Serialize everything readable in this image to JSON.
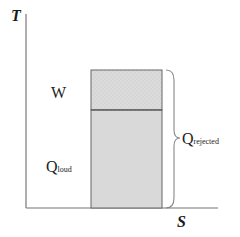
{
  "diagram": {
    "type": "T-S diagram",
    "axes": {
      "y_label": "T",
      "x_label": "S"
    },
    "regions": [
      {
        "label": "W",
        "description": "upper shaded region (work)",
        "fill": "#d8d8d8"
      },
      {
        "label_main": "Q",
        "label_sub": "loud",
        "description": "lower shaded region",
        "fill": "#d9d9d9"
      }
    ],
    "brace": {
      "label_main": "Q",
      "label_sub": "rejected",
      "spans": "full rectangle height"
    },
    "colors": {
      "axis": "#777777",
      "rect_fill": "#d9d9d9",
      "rect_stroke": "#666666",
      "brace": "#888888",
      "text": "#222222"
    }
  }
}
